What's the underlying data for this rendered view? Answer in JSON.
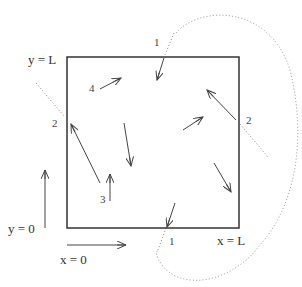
{
  "diagram": {
    "boundary_labels": {
      "top": "y = L",
      "bottom": "y = 0",
      "left": "x = 0",
      "right": "x = L"
    },
    "crossing_labels": {
      "top_1": "1",
      "bottom_1": "1",
      "left_2": "2",
      "right_2": "2",
      "particle_3": "3",
      "particle_4": "4"
    },
    "colors": {
      "box": "#333333",
      "arrow": "#444444",
      "dotted": "#999999",
      "text": "#333333"
    }
  }
}
